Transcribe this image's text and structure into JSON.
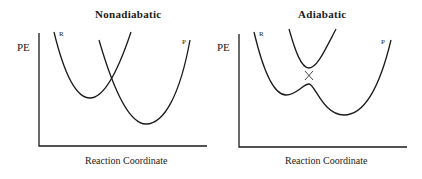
{
  "panels": [
    {
      "title": "Nonadiabatic",
      "ylabel": "PE",
      "xlabel": "Reaction Coordinate",
      "curves": [
        {
          "label": "R",
          "description": "reactant parabola"
        },
        {
          "label": "P",
          "description": "product parabola"
        }
      ],
      "feature": "diabatic curves cross"
    },
    {
      "title": "Adiabatic",
      "ylabel": "PE",
      "xlabel": "Reaction Coordinate",
      "curves": [
        {
          "label": "R",
          "description": "lower adiabatic surface (reactant side)"
        },
        {
          "label": "P",
          "description": "lower adiabatic surface (product side)"
        }
      ],
      "feature": "avoided crossing with energy gap between upper and lower surfaces"
    }
  ],
  "colors": {
    "line": "#1a1a1a",
    "background": "#ffffff"
  }
}
